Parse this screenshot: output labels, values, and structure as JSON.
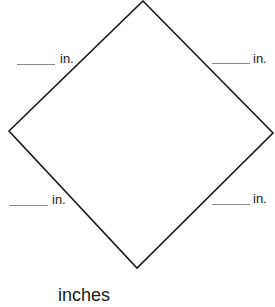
{
  "diagram": {
    "shape": "square rotated 45° (diamond)",
    "vertices": {
      "top": [
        143,
        1
      ],
      "right": [
        273,
        133
      ],
      "bottom": [
        137,
        268
      ],
      "left": [
        9,
        131
      ]
    },
    "stroke_color": "#1a1a1a",
    "side_labels": [
      {
        "position": "top-left",
        "blank": "______",
        "unit": "in."
      },
      {
        "position": "top-right",
        "blank": "______",
        "unit": "in."
      },
      {
        "position": "bottom-left",
        "blank": "______",
        "unit": "in."
      },
      {
        "position": "bottom-right",
        "blank": "______",
        "unit": "in."
      }
    ],
    "answer_unit": "inches"
  }
}
